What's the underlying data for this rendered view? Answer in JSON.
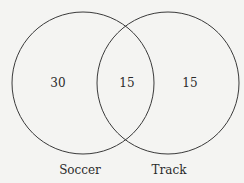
{
  "diagram": {
    "type": "venn",
    "line_color": "#3a3a3a",
    "background": "#f4f4f2",
    "sets": [
      {
        "name": "Soccer",
        "cx": 83,
        "cy": 83,
        "r": 71
      },
      {
        "name": "Track",
        "cx": 168,
        "cy": 83,
        "r": 71
      }
    ],
    "regions": {
      "soccer_only": "30",
      "both": "15",
      "track_only": "15"
    },
    "labels": {
      "soccer": "Soccer",
      "track": "Track"
    }
  }
}
